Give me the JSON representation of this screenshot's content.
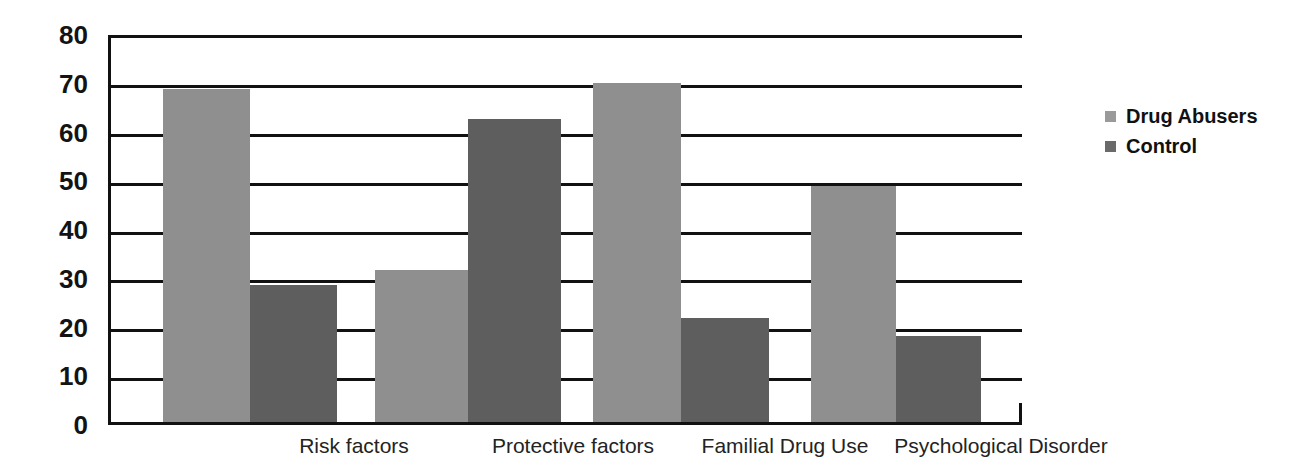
{
  "chart_data": {
    "type": "bar",
    "title": "",
    "subtitle": "",
    "xlabel": "",
    "ylabel": "",
    "ylim": [
      0,
      80
    ],
    "yticks": [
      0,
      10,
      20,
      30,
      40,
      50,
      60,
      70,
      80
    ],
    "ytick_labels": [
      "0",
      "10",
      "20",
      "30",
      "40",
      "50",
      "60",
      "70",
      "80"
    ],
    "grid": true,
    "grid_axis": "y",
    "legend_position": "right",
    "categories": [
      "Risk factors",
      "Protective factors",
      "Familial Drug Use",
      "Psychological Disorder"
    ],
    "series": [
      {
        "name": "Drug Abusers",
        "color": "#8f8f8f",
        "values": [
          68.3,
          31.2,
          69.6,
          48.5
        ]
      },
      {
        "name": "Control",
        "color": "#5e5e5e",
        "values": [
          28.2,
          62.2,
          21.4,
          17.6
        ]
      }
    ]
  },
  "legend": {
    "items": [
      {
        "label": "Drug Abusers",
        "swatch": "legend-swatch-drug-abusers"
      },
      {
        "label": "Control",
        "swatch": "legend-swatch-control"
      }
    ]
  }
}
